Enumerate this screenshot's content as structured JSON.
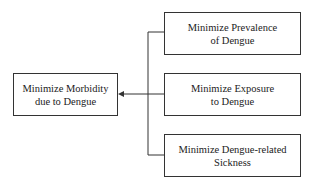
{
  "diagram": {
    "root": {
      "line1": "Minimize Morbidity",
      "line2": "due to Dengue"
    },
    "children": [
      {
        "line1": "Minimize Prevalence",
        "line2": "of Dengue"
      },
      {
        "line1": "Minimize Exposure",
        "line2": "to Dengue"
      },
      {
        "line1": "Minimize Dengue-related",
        "line2": "Sickness"
      }
    ],
    "colors": {
      "line": "#333333",
      "background": "#ffffff"
    }
  }
}
